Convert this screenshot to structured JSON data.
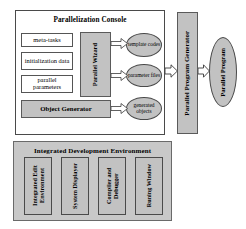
{
  "diagram": {
    "type": "block-diagram",
    "colors": {
      "fill_gray": "#c2c2c2",
      "panel_gray": "#c8c8c8",
      "stroke": "#4a4a4a",
      "background": "#ffffff"
    }
  },
  "console_panel": {
    "title": "Parallelization Console",
    "inputs": [
      {
        "label": "meta-tasks"
      },
      {
        "label": "initialization data"
      },
      {
        "label": "parallel parameters"
      }
    ],
    "wizard": {
      "label": "Parallel Wizard"
    },
    "object_generator": {
      "label": "Object Generator"
    },
    "outputs": [
      {
        "label": "template codes"
      },
      {
        "label": "parameter files"
      },
      {
        "label": "generated objects"
      }
    ]
  },
  "generator": {
    "label": "Parallel Program Generator"
  },
  "result": {
    "label": "Parallel Program"
  },
  "ide_panel": {
    "title": "Integrated Development Environment",
    "tools": [
      {
        "label": "Integrated Edit Environment"
      },
      {
        "label": "System Displayer"
      },
      {
        "label": "Compiler and Debugger"
      },
      {
        "label": "Runing Window"
      }
    ]
  },
  "arrows": [
    {
      "name": "wizard-to-template-codes"
    },
    {
      "name": "wizard-to-parameter-files"
    },
    {
      "name": "object-generator-to-generated-objects"
    },
    {
      "name": "console-to-generator"
    },
    {
      "name": "generator-to-parallel-program"
    }
  ]
}
